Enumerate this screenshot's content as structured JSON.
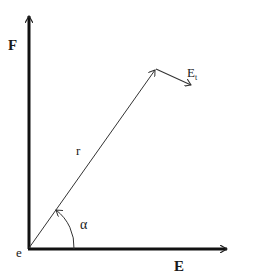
{
  "diagram": {
    "labels": {
      "y_axis": "F",
      "x_axis": "E",
      "origin": "e",
      "vector": "r",
      "angle": "α",
      "tangent_main": "E",
      "tangent_sub": "t"
    },
    "colors": {
      "axis": "#111111",
      "vector": "#333333",
      "background": "#ffffff"
    }
  }
}
